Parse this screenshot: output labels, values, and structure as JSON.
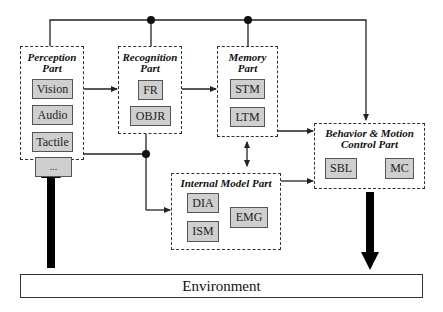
{
  "diagram": {
    "perception": {
      "title_line1": "Perception",
      "title_line2": "Part",
      "modules": [
        "Vision",
        "Audio",
        "Tactile",
        "..."
      ]
    },
    "recognition": {
      "title_line1": "Recognition",
      "title_line2": "Part",
      "modules": [
        "FR",
        "OBJR"
      ]
    },
    "memory": {
      "title_line1": "Memory",
      "title_line2": "Part",
      "modules": [
        "STM",
        "LTM"
      ]
    },
    "behavior": {
      "title_line1": "Behavior & Motion",
      "title_line2": "Control Part",
      "modules": [
        "SBL",
        "MC"
      ]
    },
    "internal_model": {
      "title": "Internal Model Part",
      "modules": [
        "DIA",
        "ISM",
        "EMG"
      ]
    },
    "environment": {
      "label": "Environment"
    }
  },
  "colors": {
    "module_fill": "#cfcfcf",
    "line": "#222222",
    "background": "#ffffff"
  }
}
